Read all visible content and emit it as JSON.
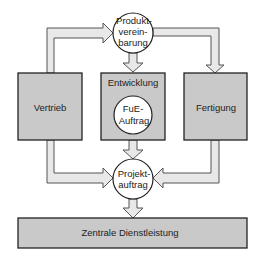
{
  "diagram": {
    "nodes": {
      "produktvereinbarung": {
        "lines": [
          "Produkt-",
          "verein-",
          "barung"
        ],
        "shape": "circle"
      },
      "vertrieb": {
        "label": "Vertrieb",
        "shape": "box"
      },
      "entwicklung": {
        "label": "Entwicklung",
        "shape": "box"
      },
      "fue_auftrag": {
        "lines": [
          "FuE-",
          "Auftrag"
        ],
        "shape": "circle"
      },
      "fertigung": {
        "label": "Fertigung",
        "shape": "box"
      },
      "projektauftrag": {
        "lines": [
          "Projekt-",
          "auftrag"
        ],
        "shape": "circle"
      },
      "zentrale_dienstleistung": {
        "label": "Zentrale Dienstleistung",
        "shape": "box"
      }
    },
    "edges": [
      {
        "from": "Vertrieb",
        "to": "Produktvereinbarung"
      },
      {
        "from": "Produktvereinbarung",
        "to": "Entwicklung"
      },
      {
        "from": "Produktvereinbarung",
        "to": "Fertigung"
      },
      {
        "from": "Entwicklung",
        "to": "Projektauftrag"
      },
      {
        "from": "Vertrieb",
        "to": "Projektauftrag"
      },
      {
        "from": "Fertigung",
        "to": "Projektauftrag"
      },
      {
        "from": "Projektauftrag",
        "to": "Zentrale Dienstleistung"
      }
    ],
    "colors": {
      "box_fill": "#c9c9c9",
      "arrow_fill": "#e8e8e8",
      "circle_fill": "#ffffff",
      "stroke": "#333333"
    }
  }
}
